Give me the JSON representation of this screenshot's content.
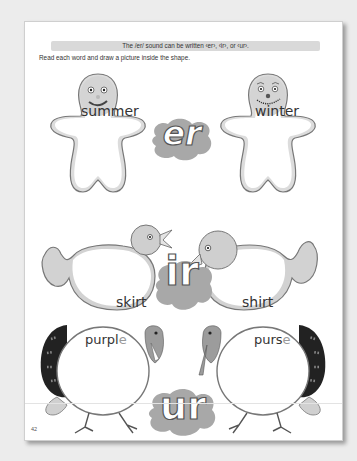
{
  "worksheet": {
    "header": "The /er/ sound can be written ‹er›, ‹ir›, or ‹ur›.",
    "instruction": "Read each word and draw a picture inside the shape.",
    "page_number": "42",
    "rows": [
      {
        "sound": "er",
        "shape": "gingerbread-man",
        "words": [
          {
            "text": "summer",
            "silent": ""
          },
          {
            "text": "winter",
            "silent": ""
          }
        ]
      },
      {
        "sound": "ir",
        "shape": "bird",
        "words": [
          {
            "text": "skirt",
            "silent": ""
          },
          {
            "text": "shirt",
            "silent": ""
          }
        ]
      },
      {
        "sound": "ur",
        "shape": "turkey",
        "words": [
          {
            "text": "purpl",
            "silent": "e"
          },
          {
            "text": "purs",
            "silent": "e"
          }
        ]
      }
    ]
  },
  "colors": {
    "background": "#ececec",
    "page": "#ffffff",
    "header_bar": "#d9d9d9",
    "shape_fill": "#d4d4d4",
    "blob": "#a8a8a8"
  }
}
